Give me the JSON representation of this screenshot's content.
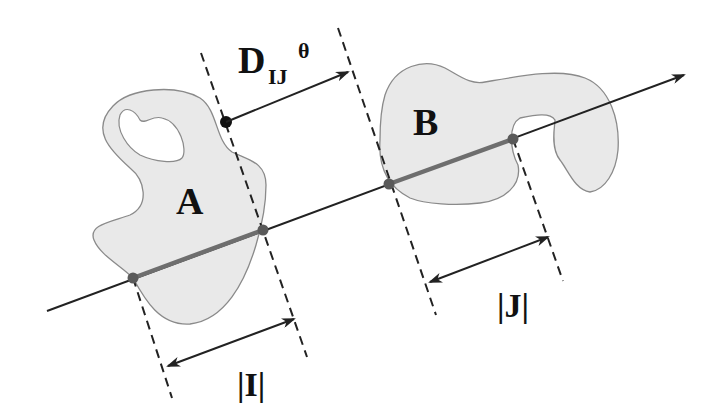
{
  "diagram": {
    "shapes": [
      {
        "id": "A",
        "label": "A"
      },
      {
        "id": "B",
        "label": "B"
      }
    ],
    "labels": {
      "distance_main": "D",
      "distance_sub": "IJ",
      "distance_sup": "θ",
      "interval_i": "|I|",
      "interval_j": "|J|"
    },
    "colors": {
      "shape_fill": "#e9e9e9",
      "shape_stroke": "#8a8a8a",
      "axis": "#222222",
      "projection_segment": "#6e6e6e",
      "intersection_dot": "#5a5a5a",
      "text": "#111111"
    }
  }
}
